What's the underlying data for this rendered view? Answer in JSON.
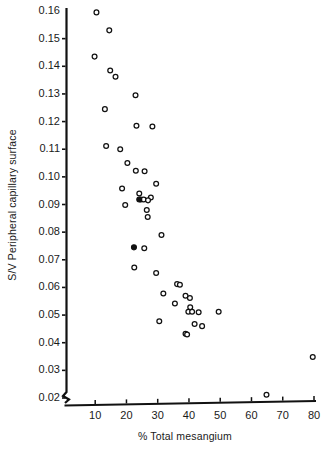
{
  "chart_data": {
    "type": "scatter",
    "title": "",
    "xlabel": "% Total mesangium",
    "ylabel": "S/V Peripheral capillary surface",
    "xlim": [
      0,
      80
    ],
    "ylim": [
      0.02,
      0.16
    ],
    "xticks": [
      10,
      20,
      30,
      40,
      50,
      60,
      70,
      80
    ],
    "xtick_labels": [
      "10",
      "20",
      "30",
      "40",
      "50",
      "60",
      "70",
      "80"
    ],
    "yticks": [
      0.02,
      0.03,
      0.04,
      0.05,
      0.06,
      0.07,
      0.08,
      0.09,
      0.1,
      0.11,
      0.12,
      0.13,
      0.14,
      0.15,
      0.16
    ],
    "ytick_labels": [
      "0.02",
      "0.03",
      "0.04",
      "0.05",
      "0.06",
      "0.07",
      "0.08",
      "0.09",
      "0.10",
      "0.11",
      "0.12",
      "0.13",
      "0.14",
      "0.15",
      "0.16"
    ],
    "grid": false,
    "legend": false,
    "axis_break_y": true,
    "marker_styles": {
      "open": "open-circle",
      "filled": "filled-circle"
    },
    "series": [
      {
        "name": "open",
        "marker": "open-circle",
        "points": [
          [
            10.4,
            0.1595
          ],
          [
            14.5,
            0.153
          ],
          [
            9.8,
            0.1435
          ],
          [
            14.8,
            0.1385
          ],
          [
            16.5,
            0.1362
          ],
          [
            22.9,
            0.1295
          ],
          [
            13.1,
            0.1245
          ],
          [
            23.2,
            0.1185
          ],
          [
            28.3,
            0.1182
          ],
          [
            13.5,
            0.1112
          ],
          [
            18.0,
            0.11
          ],
          [
            20.3,
            0.105
          ],
          [
            23.0,
            0.1022
          ],
          [
            25.8,
            0.102
          ],
          [
            29.5,
            0.0975
          ],
          [
            18.6,
            0.0958
          ],
          [
            24.1,
            0.094
          ],
          [
            27.8,
            0.0925
          ],
          [
            24.6,
            0.0918
          ],
          [
            25.5,
            0.0918
          ],
          [
            26.9,
            0.0915
          ],
          [
            19.6,
            0.0898
          ],
          [
            26.5,
            0.088
          ],
          [
            26.8,
            0.0855
          ],
          [
            31.2,
            0.079
          ],
          [
            25.7,
            0.0742
          ],
          [
            22.5,
            0.0672
          ],
          [
            29.5,
            0.0652
          ],
          [
            36.2,
            0.0612
          ],
          [
            37.1,
            0.061
          ],
          [
            31.8,
            0.0578
          ],
          [
            38.9,
            0.057
          ],
          [
            40.3,
            0.0562
          ],
          [
            35.5,
            0.0542
          ],
          [
            40.4,
            0.0528
          ],
          [
            39.8,
            0.0512
          ],
          [
            41.0,
            0.0512
          ],
          [
            43.1,
            0.051
          ],
          [
            49.5,
            0.0512
          ],
          [
            30.5,
            0.0478
          ],
          [
            41.8,
            0.0468
          ],
          [
            44.2,
            0.046
          ],
          [
            38.9,
            0.0432
          ],
          [
            39.4,
            0.043
          ],
          [
            79.6,
            0.0348
          ],
          [
            64.8,
            0.0212
          ]
        ]
      },
      {
        "name": "filled",
        "marker": "filled-circle",
        "points": [
          [
            24.1,
            0.0918
          ],
          [
            22.4,
            0.0745
          ]
        ]
      }
    ]
  },
  "axes": {
    "x_axis_name": "x-axis",
    "y_axis_name": "y-axis"
  }
}
